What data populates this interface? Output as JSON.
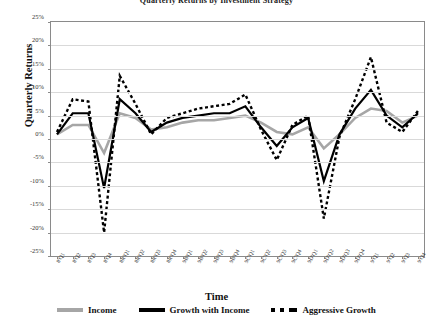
{
  "chart_data": {
    "type": "line",
    "title": "Quarterly Returns by Investment Strategy",
    "xlabel": "Time",
    "ylabel": "Quarterly Returns",
    "ylim": [
      -25,
      25
    ],
    "ytick_step": 5,
    "grid": true,
    "legend_position": "bottom",
    "categories": [
      "8'Q1",
      "8'Q2",
      "8'Q3",
      "8'Q4",
      "8R'Q1",
      "8R'Q2",
      "8R'Q3",
      "8R'Q4",
      "9B'Q1",
      "9B'Q2",
      "9B'Q3",
      "9B'Q4",
      "9C'Q1",
      "9C'Q2",
      "9C'Q3",
      "9C'Q4",
      "9D'Q1",
      "9D'Q2",
      "9D'Q3",
      "9D'Q4",
      "9'Q1",
      "9'Q2",
      "9'Q3",
      "9'Q4"
    ],
    "ytick_labels": [
      "25%",
      "20%",
      "15%",
      "10%",
      "5%",
      "0%",
      "-5%",
      "-10%",
      "-15%",
      "-20%",
      "-25%"
    ],
    "ytick_values": [
      25,
      20,
      15,
      10,
      5,
      0,
      -5,
      -10,
      -15,
      -20,
      -25
    ],
    "series": [
      {
        "name": "Income",
        "color": "#a6a6a6",
        "style": "solid",
        "values": [
          1.0,
          3.0,
          3.0,
          -3.0,
          5.5,
          4.5,
          2.0,
          2.5,
          3.5,
          4.0,
          4.0,
          4.5,
          5.0,
          3.5,
          1.5,
          1.0,
          2.5,
          -2.0,
          1.0,
          4.5,
          6.5,
          6.0,
          3.5,
          5.0
        ]
      },
      {
        "name": "Growth with Income",
        "color": "#000000",
        "style": "solid",
        "values": [
          1.0,
          5.5,
          5.5,
          -10.5,
          8.5,
          5.5,
          1.5,
          3.5,
          4.5,
          5.0,
          5.5,
          5.5,
          7.0,
          2.5,
          -1.5,
          2.5,
          4.5,
          -9.0,
          1.0,
          6.5,
          10.5,
          5.0,
          2.5,
          5.5
        ]
      },
      {
        "name": "Aggressive Growth",
        "color": "#000000",
        "style": "dashed",
        "values": [
          1.5,
          8.5,
          8.0,
          -20.0,
          13.5,
          7.5,
          1.0,
          4.5,
          5.5,
          6.5,
          7.0,
          7.5,
          9.5,
          2.0,
          -4.5,
          3.0,
          5.0,
          -17.0,
          0.5,
          8.5,
          17.5,
          3.5,
          1.5,
          6.0
        ]
      }
    ]
  },
  "legend": {
    "items": [
      {
        "label": "Income"
      },
      {
        "label": "Growth with Income"
      },
      {
        "label": "Aggressive Growth"
      }
    ]
  }
}
